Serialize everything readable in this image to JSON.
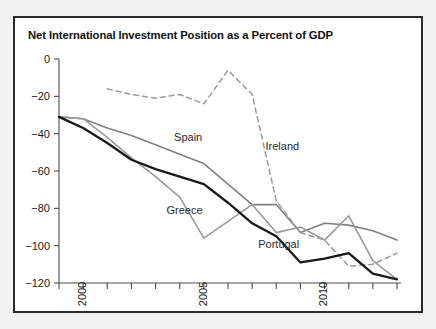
{
  "chart_data": {
    "type": "line",
    "title": "Net International Investment Position as a Percent of GDP",
    "xlabel": "",
    "ylabel": "",
    "xlim": [
      1999,
      2013
    ],
    "ylim": [
      -120,
      0
    ],
    "yticks": [
      0,
      -20,
      -40,
      -60,
      -80,
      -100,
      -120
    ],
    "ytick_labels": [
      "0",
      "−20",
      "−40",
      "−60",
      "−80",
      "−100",
      "−120"
    ],
    "xticks": [
      1999,
      2000,
      2001,
      2002,
      2003,
      2004,
      2005,
      2006,
      2007,
      2008,
      2009,
      2010,
      2011,
      2012,
      2013
    ],
    "xtick_labels_shown": [
      {
        "x": 2000,
        "label": "2000"
      },
      {
        "x": 2005,
        "label": "2005"
      },
      {
        "x": 2010,
        "label": "2010"
      }
    ],
    "grid": false,
    "legend": "inline-annotations",
    "series": [
      {
        "name": "Spain",
        "style": "solid",
        "color": "#808080",
        "width": 1.6,
        "x": [
          1999,
          2000,
          2001,
          2002,
          2003,
          2004,
          2005,
          2006,
          2007,
          2008,
          2009,
          2010,
          2011,
          2012,
          2013
        ],
        "values": [
          -31,
          -32,
          -37,
          -41,
          -46,
          -51,
          -56,
          -67,
          -78,
          -78,
          -93,
          -88,
          -89,
          -92,
          -97
        ]
      },
      {
        "name": "Ireland",
        "style": "dashed",
        "color": "#9a9a9a",
        "width": 1.5,
        "x": [
          2001,
          2002,
          2003,
          2004,
          2005,
          2006,
          2007,
          2008,
          2009,
          2010,
          2011,
          2012,
          2013
        ],
        "values": [
          -16,
          -19,
          -21,
          -19,
          -24,
          -6,
          -19,
          -76,
          -93,
          -97,
          -111,
          -110,
          -104
        ]
      },
      {
        "name": "Greece",
        "style": "solid",
        "color": "#9a9a9a",
        "width": 1.6,
        "x": [
          1999,
          2000,
          2001,
          2002,
          2003,
          2004,
          2005,
          2006,
          2007,
          2008,
          2009,
          2010,
          2011,
          2012,
          2013
        ],
        "values": [
          -31,
          -32,
          -42,
          -53,
          -63,
          -74,
          -96,
          -87,
          -78,
          -93,
          -90,
          -97,
          -84,
          -108,
          -118
        ]
      },
      {
        "name": "Portugal",
        "style": "solid",
        "color": "#1a1a1a",
        "width": 2.3,
        "x": [
          1999,
          2000,
          2001,
          2002,
          2003,
          2004,
          2005,
          2006,
          2007,
          2008,
          2009,
          2010,
          2011,
          2012,
          2013
        ],
        "values": [
          -31,
          -37,
          -45,
          -54,
          -59,
          -63,
          -67,
          -77,
          -88,
          -95,
          -109,
          -107,
          -104,
          -115,
          -118
        ]
      }
    ],
    "annotations": [
      {
        "text": "Spain",
        "x": 2004.35,
        "y": -44
      },
      {
        "text": "Ireland",
        "x": 2008.25,
        "y": -49
      },
      {
        "text": "Greece",
        "x": 2004.2,
        "y": -83
      },
      {
        "text": "Portugal",
        "x": 2008.1,
        "y": -101
      }
    ]
  }
}
